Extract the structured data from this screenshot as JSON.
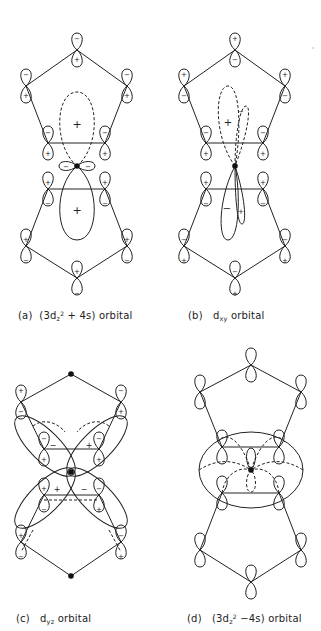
{
  "figure": {
    "panels": [
      {
        "id": "a",
        "label": "(a)",
        "caption_pre": "(3d",
        "caption_sub": "z",
        "caption_sup": "2",
        "caption_post": " + 4s) orbital",
        "ligand_p_phases_top": [
          "−/+",
          "−/+",
          "−/+",
          "−/+",
          "−/+"
        ],
        "metal_lobe_signs": [
          "+",
          "+",
          "−",
          "−"
        ]
      },
      {
        "id": "b",
        "label": "(b)",
        "caption_pre": "d",
        "caption_sub": "xy",
        "caption_post": " orbital",
        "metal_lobe_signs": [
          "+",
          "−",
          "−",
          "+"
        ]
      },
      {
        "id": "c",
        "label": "(c)",
        "caption_pre": "d",
        "caption_sub": "yz",
        "caption_post": " orbital",
        "metal_lobe_signs": [
          "−",
          "+",
          "+",
          "−"
        ]
      },
      {
        "id": "d",
        "label": "(d)",
        "caption_pre": "(3d",
        "caption_sub": "z",
        "caption_sup": "2",
        "caption_post": " −4s) orbital",
        "metal_lobe_signs": []
      }
    ],
    "signs": {
      "plus": "+",
      "minus": "−"
    },
    "colors": {
      "ink": "#222222",
      "background": "#ffffff"
    }
  }
}
